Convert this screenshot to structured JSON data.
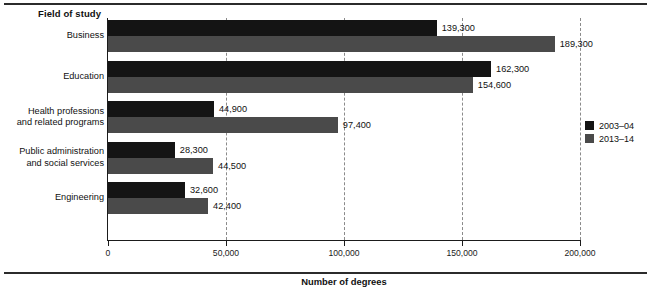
{
  "header": {
    "field_title": "Field of study"
  },
  "chart_data": {
    "type": "bar",
    "orientation": "horizontal",
    "title": "",
    "xlabel": "Number of degrees",
    "ylabel": "Field of study",
    "xlim": [
      0,
      200000
    ],
    "xticks": [
      0,
      50000,
      100000,
      150000,
      200000
    ],
    "xtick_labels": [
      "0",
      "50,000",
      "100,000",
      "150,000",
      "200,000"
    ],
    "grid": "vertical-dashed",
    "legend_position": "right",
    "categories": [
      "Business",
      "Education",
      "Health professions and related programs",
      "Public administration and social services",
      "Engineering"
    ],
    "category_lines": [
      [
        "Business"
      ],
      [
        "Education"
      ],
      [
        "Health professions",
        "and related programs"
      ],
      [
        "Public administration",
        "and social services"
      ],
      [
        "Engineering"
      ]
    ],
    "series": [
      {
        "name": "2003–04",
        "color": "#141414",
        "values": [
          139300,
          162300,
          44900,
          28300,
          32600
        ],
        "labels": [
          "139,300",
          "162,300",
          "44,900",
          "28,300",
          "32,600"
        ]
      },
      {
        "name": "2013–14",
        "color": "#4a4a4a",
        "values": [
          189300,
          154600,
          97400,
          44500,
          42400
        ],
        "labels": [
          "189,300",
          "154,600",
          "97,400",
          "44,500",
          "42,400"
        ]
      }
    ]
  },
  "legend": {
    "items": [
      {
        "label": "2003–04",
        "color": "#141414"
      },
      {
        "label": "2013–14",
        "color": "#4a4a4a"
      }
    ]
  }
}
